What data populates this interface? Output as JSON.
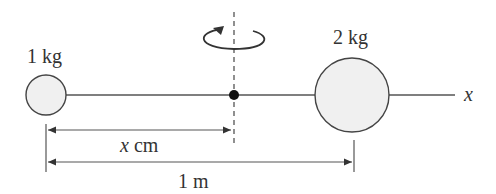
{
  "diagram": {
    "masses": [
      {
        "label": "1 kg",
        "mass_kg": 1,
        "position": "left end"
      },
      {
        "label": "2 kg",
        "mass_kg": 2,
        "position": "1 m from left mass"
      }
    ],
    "axis_label": "x",
    "rotation_axis": "vertical dashed line through pivot point",
    "dimensions": [
      {
        "label": "x cm",
        "from": "1 kg mass",
        "to": "pivot"
      },
      {
        "label": "1 m",
        "from": "1 kg mass",
        "to": "2 kg mass"
      }
    ],
    "colors": {
      "stroke": "#333333",
      "mass_fill": "#f0f0f0",
      "pivot": "#111111"
    }
  }
}
